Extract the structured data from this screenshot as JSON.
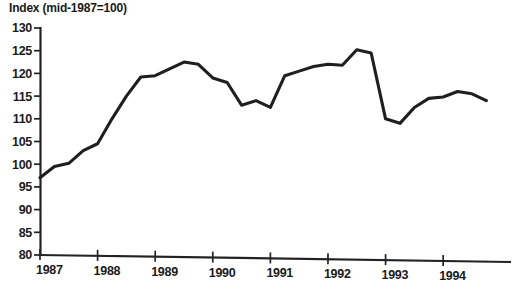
{
  "chart_data": {
    "type": "line",
    "title": "Index (mid-1987=100)",
    "xlabel": "",
    "ylabel": "",
    "ylim": [
      80,
      130
    ],
    "ytick_step": 5,
    "yticks": [
      80,
      85,
      90,
      95,
      100,
      105,
      110,
      115,
      120,
      125,
      130
    ],
    "xticks": [
      "1987",
      "1988",
      "1989",
      "1990",
      "1991",
      "1992",
      "1993",
      "1994"
    ],
    "xtick_values": [
      1987,
      1988,
      1989,
      1990,
      1991,
      1992,
      1993,
      1994
    ],
    "xlim": [
      1987.0,
      1994.9
    ],
    "grid": false,
    "legend": false,
    "series": [
      {
        "name": "Index",
        "color": "#201f1f",
        "x": [
          1987.0,
          1987.25,
          1987.5,
          1987.75,
          1988.0,
          1988.25,
          1988.5,
          1988.75,
          1989.0,
          1989.25,
          1989.5,
          1989.75,
          1990.0,
          1990.25,
          1990.5,
          1990.75,
          1991.0,
          1991.25,
          1991.5,
          1991.75,
          1992.0,
          1992.25,
          1992.5,
          1992.75,
          1993.0,
          1993.25,
          1993.5,
          1993.75,
          1994.0,
          1994.25,
          1994.5,
          1994.75
        ],
        "values": [
          97.0,
          99.5,
          100.2,
          103.0,
          104.5,
          110.0,
          115.0,
          119.2,
          119.5,
          121.0,
          122.5,
          122.0,
          119.0,
          118.0,
          113.0,
          114.0,
          112.5,
          119.5,
          120.5,
          121.5,
          122.0,
          121.8,
          125.2,
          124.5,
          110.0,
          109.0,
          112.5,
          114.5,
          114.8,
          116.0,
          115.5,
          114.0
        ]
      }
    ],
    "annotations": []
  },
  "axis": {
    "y_axis_name": "y-axis",
    "x_axis_name": "x-axis"
  }
}
